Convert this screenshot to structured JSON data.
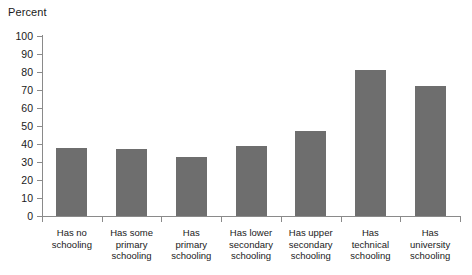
{
  "chart_data": {
    "type": "bar",
    "title": "",
    "ylabel": "Percent",
    "xlabel": "",
    "ylim": [
      0,
      100
    ],
    "yticks": [
      0,
      10,
      20,
      30,
      40,
      50,
      60,
      70,
      80,
      90,
      100
    ],
    "grid": false,
    "legend": null,
    "bar_color": "#6e6e6e",
    "axis_color": "#8a8a8a",
    "categories": [
      "Has no\nschooling",
      "Has some\nprimary\nschooling",
      "Has\nprimary\nschooling",
      "Has lower\nsecondary\nschooling",
      "Has upper\nsecondary\nschooling",
      "Has\ntechnical\nschooling",
      "Has\nuniversity\nschooling"
    ],
    "values": [
      38,
      37,
      33,
      39,
      47,
      81,
      72
    ]
  }
}
